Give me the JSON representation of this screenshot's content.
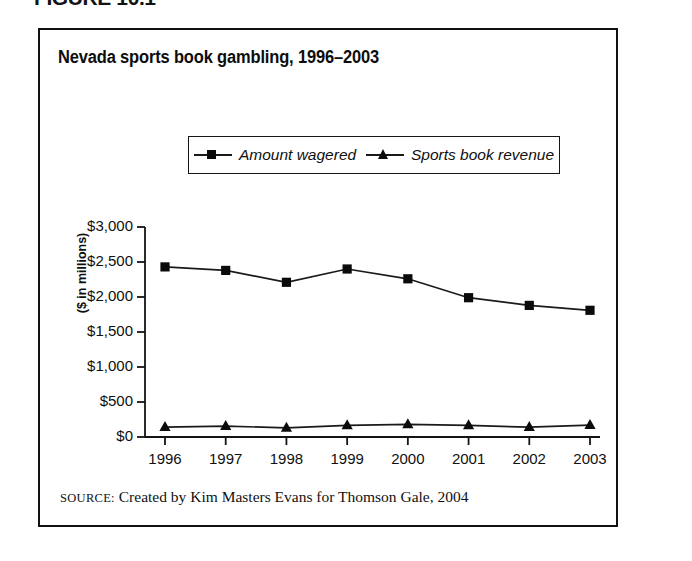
{
  "figure": {
    "label": "FIGURE 10.1",
    "title": "Nevada sports book gambling, 1996–2003",
    "source_keyword": "SOURCE:",
    "source_text": " Created by Kim Masters Evans for Thomson Gale, 2004"
  },
  "legend": {
    "items": [
      {
        "label": "Amount wagered",
        "marker": "square-marker-icon",
        "color": "#0b0b0b"
      },
      {
        "label": "Sports book revenue",
        "marker": "triangle-marker-icon",
        "color": "#0b0b0b"
      }
    ]
  },
  "colors": {
    "line": "#1a1a1a",
    "marker": "#0b0b0b",
    "frame": "#111111",
    "axis": "#141414",
    "background": "#ffffff"
  },
  "chart_data": {
    "type": "line",
    "title": "Nevada sports book gambling, 1996–2003",
    "xlabel": "",
    "ylabel": "($ in millions)",
    "categories": [
      "1996",
      "1997",
      "1998",
      "1999",
      "2000",
      "2001",
      "2002",
      "2003"
    ],
    "ylim": [
      0,
      3000
    ],
    "yticks": [
      0,
      500,
      1000,
      1500,
      2000,
      2500,
      3000
    ],
    "ytick_labels": [
      "$0",
      "$500",
      "$1,000",
      "$1,500",
      "$2,000",
      "$2,500",
      "$3,000"
    ],
    "grid": false,
    "legend_position": "top-center",
    "series": [
      {
        "name": "Amount wagered",
        "marker": "square",
        "values": [
          2430,
          2380,
          2210,
          2400,
          2260,
          1990,
          1880,
          1810
        ]
      },
      {
        "name": "Sports book revenue",
        "marker": "triangle",
        "values": [
          140,
          155,
          130,
          165,
          180,
          165,
          140,
          170
        ]
      }
    ]
  }
}
